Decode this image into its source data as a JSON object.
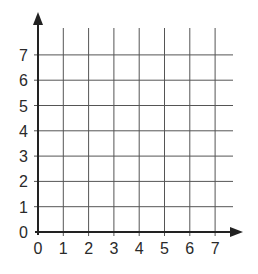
{
  "diagram": {
    "type": "coordinate-grid",
    "x_axis": {
      "ticks": [
        "0",
        "1",
        "2",
        "3",
        "4",
        "5",
        "6",
        "7"
      ]
    },
    "y_axis": {
      "ticks": [
        "0",
        "1",
        "2",
        "3",
        "4",
        "5",
        "6",
        "7"
      ]
    },
    "colors": {
      "axis": "#222222",
      "grid": "#555555",
      "text": "#2a2a2a",
      "background": "#ffffff"
    }
  }
}
